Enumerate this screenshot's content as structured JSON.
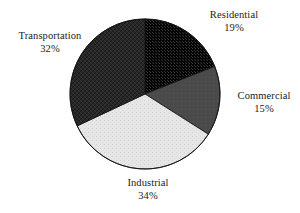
{
  "chart_data": {
    "type": "pie",
    "title": "",
    "subtitle": "",
    "xlabel": "",
    "ylabel": "",
    "legend_position": "none",
    "grid": false,
    "units": "percent",
    "total": 100,
    "start_angle_deg": 0,
    "direction": "clockwise",
    "categories": [
      "Residential",
      "Commercial",
      "Industrial",
      "Transportation"
    ],
    "values": [
      19,
      15,
      34,
      32
    ],
    "slices": [
      {
        "label": "Residential",
        "value": 19,
        "value_text": "19%",
        "fill": "#0d0d0d",
        "pattern": "dotted-stipple",
        "stroke": "#111111",
        "start_deg": 0,
        "end_deg": 68.4,
        "label_position": "upper-right"
      },
      {
        "label": "Commercial",
        "value": 15,
        "value_text": "15%",
        "fill": "#4a4a4a",
        "pattern": "solid",
        "stroke": "#111111",
        "start_deg": 68.4,
        "end_deg": 122.4,
        "label_position": "right"
      },
      {
        "label": "Industrial",
        "value": 34,
        "value_text": "34%",
        "fill": "#e3e3e3",
        "pattern": "light-grain",
        "stroke": "#111111",
        "start_deg": 122.4,
        "end_deg": 244.8,
        "label_position": "bottom"
      },
      {
        "label": "Transportation",
        "value": 32,
        "value_text": "32%",
        "fill": "#2b2b2b",
        "pattern": "crosshatch",
        "stroke": "#111111",
        "start_deg": 244.8,
        "end_deg": 360,
        "label_position": "upper-left"
      }
    ],
    "geometry": {
      "center_x": 145,
      "center_y": 94,
      "radius": 75
    },
    "colors": {
      "background": "#ffffff",
      "text": "#1b1b1b",
      "outline": "#111111"
    }
  }
}
